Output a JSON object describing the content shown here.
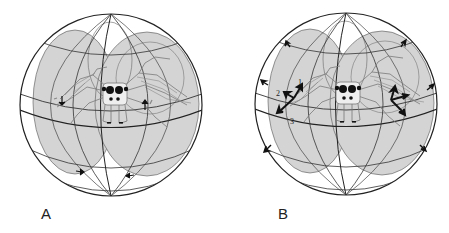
{
  "figure": {
    "panels": [
      {
        "id": "A",
        "label": "A",
        "center": [
          111,
          105
        ],
        "radius": 91,
        "arrow_style": "small-ventral-markers"
      },
      {
        "id": "B",
        "label": "B",
        "center": [
          346,
          104
        ],
        "radius": 91,
        "arrow_style": "large-vector-arrows",
        "vector_labels": [
          "1",
          "2",
          "3"
        ]
      }
    ],
    "colors": {
      "field_fill": "#d4d4d4",
      "grid_line": "#333333",
      "spider_line": "#777777",
      "arrow": "#111111",
      "background": "#ffffff"
    }
  }
}
